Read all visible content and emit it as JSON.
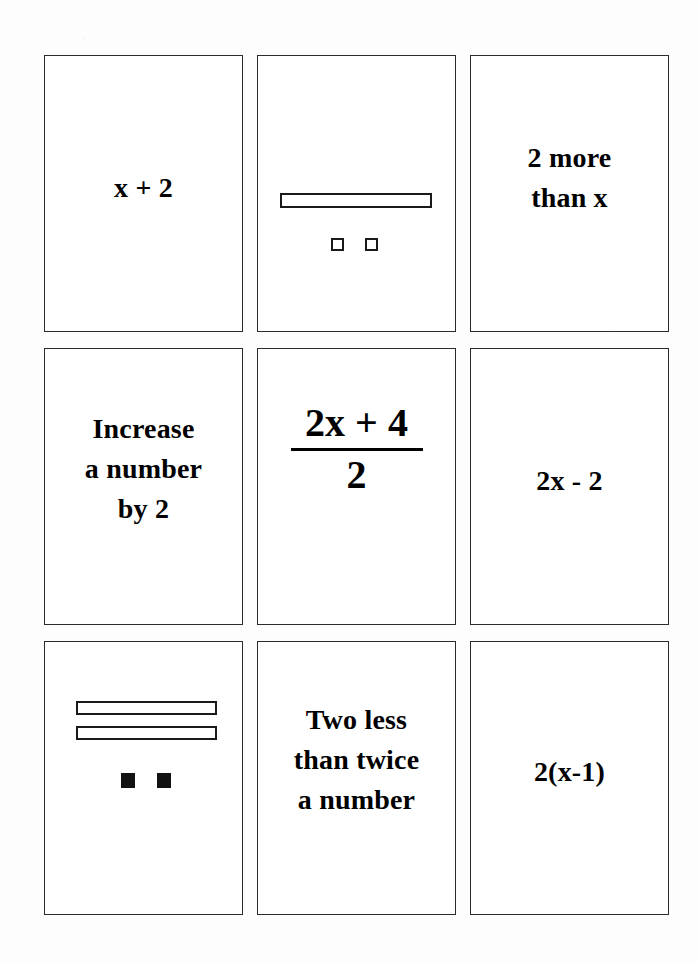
{
  "page": {
    "background_color": "#fdfdfd",
    "card_border_color": "#2b2b2b",
    "ink_color": "#000000",
    "columns": 3,
    "rows": 3
  },
  "cards": [
    {
      "id": "card-1",
      "row": 1,
      "column": 1,
      "kind": "expression",
      "text": "x + 2"
    },
    {
      "id": "card-2",
      "row": 1,
      "column": 2,
      "kind": "tile-diagram",
      "text": "",
      "diagram": {
        "description": "algebra tiles: one x-bar and two positive unit squares",
        "bars": [
          {
            "label": "x-tile",
            "fill": "hollow"
          }
        ],
        "units": [
          {
            "label": "unit-tile",
            "fill": "hollow"
          },
          {
            "label": "unit-tile",
            "fill": "hollow"
          }
        ],
        "represents": "x + 2"
      }
    },
    {
      "id": "card-3",
      "row": 1,
      "column": 3,
      "kind": "phrase",
      "text": "2 more\nthan x"
    },
    {
      "id": "card-4",
      "row": 2,
      "column": 1,
      "kind": "phrase",
      "text": "Increase\na number\nby 2"
    },
    {
      "id": "card-5",
      "row": 2,
      "column": 2,
      "kind": "fraction",
      "text": "",
      "fraction": {
        "numerator": "2x + 4",
        "denominator": "2"
      }
    },
    {
      "id": "card-6",
      "row": 2,
      "column": 3,
      "kind": "expression",
      "text": "2x - 2"
    },
    {
      "id": "card-7",
      "row": 3,
      "column": 1,
      "kind": "tile-diagram",
      "text": "",
      "diagram": {
        "description": "algebra tiles: two x-bars and two negative unit squares",
        "bars": [
          {
            "label": "x-tile",
            "fill": "hollow"
          },
          {
            "label": "x-tile",
            "fill": "hollow"
          }
        ],
        "units": [
          {
            "label": "negative-unit-tile",
            "fill": "solid"
          },
          {
            "label": "negative-unit-tile",
            "fill": "solid"
          }
        ],
        "represents": "2x - 2"
      }
    },
    {
      "id": "card-8",
      "row": 3,
      "column": 2,
      "kind": "phrase",
      "text": "Two less\nthan twice\na number"
    },
    {
      "id": "card-9",
      "row": 3,
      "column": 3,
      "kind": "expression",
      "text": "2(x-1)"
    }
  ]
}
